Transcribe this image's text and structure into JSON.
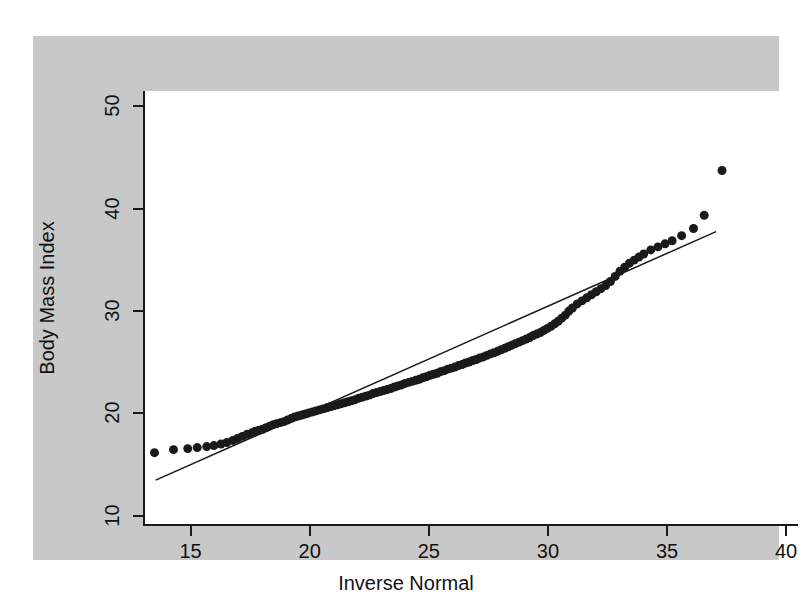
{
  "figure": {
    "background_color": "#c8c8c8",
    "plot_background_color": "#ffffff",
    "axis_color": "#1a1a1a",
    "marker_color": "#1a1a1a",
    "line_color": "#1a1a1a"
  },
  "chart_data": {
    "type": "scatter",
    "title": "",
    "subtitle": "",
    "xlabel": "Inverse Normal",
    "ylabel": "Body Mass Index",
    "xlim": [
      13.0,
      40.5
    ],
    "ylim": [
      9.0,
      51.5
    ],
    "xticks": [
      15,
      20,
      25,
      30,
      35,
      40
    ],
    "yticks": [
      10,
      20,
      30,
      40,
      50
    ],
    "xtick_labels": [
      "15",
      "20",
      "25",
      "30",
      "35",
      "40"
    ],
    "ytick_labels": [
      "10",
      "20",
      "30",
      "40",
      "50"
    ],
    "grid": false,
    "legend": null,
    "legend_position": "none",
    "annotations": [],
    "series": [
      {
        "name": "Body Mass Index quantiles",
        "type": "scatter",
        "marker": "circle",
        "marker_size": 9,
        "color": "#1a1a1a",
        "x": [
          13.4,
          14.2,
          14.8,
          15.2,
          15.6,
          15.9,
          16.2,
          16.45,
          16.7,
          16.9,
          17.1,
          17.3,
          17.5,
          17.65,
          17.8,
          17.95,
          18.1,
          18.25,
          18.4,
          18.55,
          18.7,
          18.85,
          19.0,
          19.15,
          19.3,
          19.45,
          19.6,
          19.75,
          19.9,
          20.05,
          20.2,
          20.35,
          20.5,
          20.65,
          20.8,
          20.95,
          21.1,
          21.25,
          21.4,
          21.55,
          21.7,
          21.85,
          22.0,
          22.15,
          22.3,
          22.45,
          22.6,
          22.75,
          22.9,
          23.05,
          23.2,
          23.35,
          23.5,
          23.65,
          23.8,
          23.95,
          24.1,
          24.25,
          24.4,
          24.55,
          24.7,
          24.85,
          25.0,
          25.15,
          25.3,
          25.45,
          25.6,
          25.75,
          25.9,
          26.05,
          26.2,
          26.35,
          26.5,
          26.65,
          26.8,
          26.95,
          27.1,
          27.25,
          27.4,
          27.55,
          27.7,
          27.85,
          28.0,
          28.15,
          28.3,
          28.45,
          28.6,
          28.75,
          28.9,
          29.05,
          29.2,
          29.35,
          29.5,
          29.65,
          29.8,
          29.95,
          30.1,
          30.25,
          30.4,
          30.55,
          30.7,
          30.85,
          31.0,
          31.2,
          31.4,
          31.6,
          31.8,
          32.0,
          32.2,
          32.4,
          32.6,
          32.8,
          33.0,
          33.2,
          33.4,
          33.6,
          33.8,
          34.0,
          34.3,
          34.6,
          34.9,
          35.2,
          35.6,
          36.1,
          36.55,
          37.3
        ],
        "y": [
          16.0,
          16.3,
          16.4,
          16.5,
          16.6,
          16.7,
          16.85,
          17.0,
          17.2,
          17.4,
          17.6,
          17.8,
          17.95,
          18.1,
          18.2,
          18.3,
          18.45,
          18.6,
          18.75,
          18.85,
          18.95,
          19.05,
          19.2,
          19.35,
          19.5,
          19.6,
          19.7,
          19.8,
          19.9,
          20.0,
          20.1,
          20.2,
          20.3,
          20.4,
          20.5,
          20.6,
          20.7,
          20.8,
          20.9,
          21.0,
          21.1,
          21.2,
          21.35,
          21.45,
          21.55,
          21.65,
          21.8,
          21.9,
          22.0,
          22.1,
          22.2,
          22.3,
          22.45,
          22.55,
          22.65,
          22.8,
          22.9,
          23.0,
          23.1,
          23.2,
          23.35,
          23.45,
          23.6,
          23.7,
          23.8,
          23.95,
          24.05,
          24.2,
          24.3,
          24.4,
          24.55,
          24.65,
          24.8,
          24.9,
          25.05,
          25.15,
          25.3,
          25.4,
          25.55,
          25.7,
          25.8,
          25.95,
          26.1,
          26.25,
          26.4,
          26.55,
          26.7,
          26.85,
          27.0,
          27.15,
          27.3,
          27.5,
          27.65,
          27.8,
          28.0,
          28.2,
          28.4,
          28.65,
          28.9,
          29.2,
          29.5,
          29.9,
          30.2,
          30.6,
          30.9,
          31.2,
          31.5,
          31.8,
          32.1,
          32.4,
          32.8,
          33.3,
          33.8,
          34.2,
          34.6,
          34.9,
          35.2,
          35.5,
          35.9,
          36.2,
          36.5,
          36.8,
          37.3,
          38.0,
          39.3,
          43.7
        ]
      },
      {
        "name": "reference line",
        "type": "line",
        "color": "#1a1a1a",
        "line_width": 1.5,
        "x": [
          13.45,
          37.05
        ],
        "y": [
          13.3,
          37.7
        ]
      }
    ]
  },
  "axes": {
    "x_axis_name": "Inverse Normal",
    "y_axis_name": "Body Mass Index"
  }
}
